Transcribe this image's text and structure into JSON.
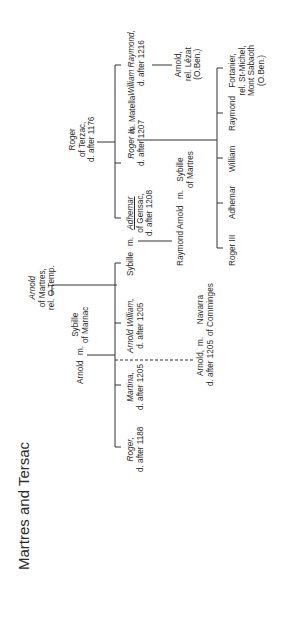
{
  "title": "Martres and Tersac",
  "people": {
    "arnold_martres": {
      "name": "Arnold",
      "l2": "of Martres,",
      "l3": "rel. O.Temp."
    },
    "arnold": {
      "name": "Arnold"
    },
    "m1": "m.",
    "sybille_marnac": {
      "name": "Sybille",
      "l2": "of Marnac"
    },
    "roger_1188": {
      "name": "Roger,",
      "l2": "d. after 1188"
    },
    "martina": {
      "name": "Martina,",
      "l2": "d. after 1205"
    },
    "arnold_william": {
      "name": "Arnold William,",
      "l2": "d. after 1205"
    },
    "sybille": {
      "name": "Sybille"
    },
    "m2": "m.",
    "adhemar_gensac": {
      "name": "Adhemar",
      "l2": "of Gensac,",
      "l3": "d. after 1208"
    },
    "arnold_1205": {
      "name": "Arnold,",
      "l2": "d. after 1205"
    },
    "m3": "m.",
    "navarra": {
      "name": "Navarra",
      "l2": "of Comminges"
    },
    "raymond_arnold": {
      "name": "Raymond Arnold"
    },
    "m4": "m.",
    "sybille_martres": {
      "name": "Sybille",
      "l2": "of Martres"
    },
    "roger_terzac": {
      "name": "Roger",
      "l2": "of Terzac,",
      "l3": "d. after 1176"
    },
    "roger_ii": {
      "name": "Roger II,",
      "l2": "d. after 1207"
    },
    "m5": "m.",
    "matella": {
      "name": "Matella"
    },
    "william_raymond": {
      "name": "William Raymond,",
      "l2": "d. after 1216"
    },
    "arnold_lezat": {
      "name": "Arnold,",
      "l2": "rel. Lézat",
      "l3": "(O.Ben.)"
    },
    "roger_iii": {
      "name": "Roger III"
    },
    "adhemar": {
      "name": "Adhemar"
    },
    "william": {
      "name": "William"
    },
    "raymond": {
      "name": "Raymond"
    },
    "fortanier": {
      "name": "Fortanier,",
      "l2": "rel. St-Michel,",
      "l3": "Mont Sabaoth",
      "l4": "(O.Ben.)"
    }
  },
  "colors": {
    "line": "#333333",
    "text": "#2a2a2a",
    "background": "#ffffff"
  }
}
